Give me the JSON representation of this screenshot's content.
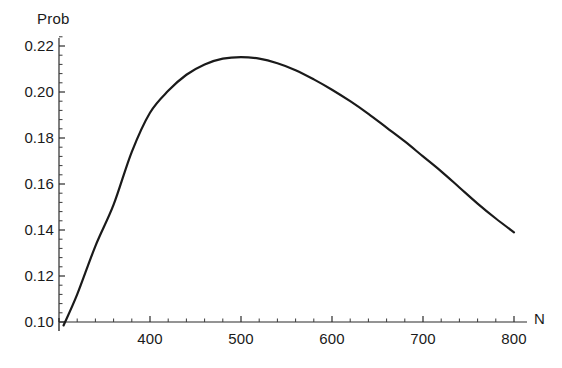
{
  "chart_data": {
    "type": "line",
    "title": "",
    "xlabel": "N",
    "ylabel": "Prob",
    "xlim": [
      300,
      812
    ],
    "ylim": [
      0.098,
      0.224
    ],
    "grid": false,
    "legend": null,
    "xticks": [
      400,
      500,
      600,
      700,
      800
    ],
    "xtick_labels": [
      "400",
      "500",
      "600",
      "700",
      "800"
    ],
    "yticks": [
      0.1,
      0.12,
      0.14,
      0.16,
      0.18,
      0.2,
      0.22
    ],
    "ytick_labels": [
      "0.10",
      "0.12",
      "0.14",
      "0.16",
      "0.18",
      "0.20",
      "0.22"
    ],
    "minor_tick_count_between": 4,
    "series": [
      {
        "name": "Prob",
        "color": "#1a1a1a",
        "x": [
          305,
          320,
          340,
          360,
          380,
          400,
          420,
          440,
          460,
          480,
          500,
          520,
          540,
          560,
          580,
          600,
          620,
          640,
          660,
          680,
          700,
          720,
          740,
          760,
          780,
          800
        ],
        "y": [
          0.0985,
          0.112,
          0.133,
          0.151,
          0.174,
          0.191,
          0.2005,
          0.2075,
          0.212,
          0.2145,
          0.2152,
          0.2145,
          0.2125,
          0.2095,
          0.2055,
          0.201,
          0.196,
          0.1905,
          0.1845,
          0.1785,
          0.172,
          0.1655,
          0.1585,
          0.1515,
          0.145,
          0.139
        ]
      }
    ]
  },
  "axes": {
    "y_title": "Prob",
    "x_title": "N"
  }
}
